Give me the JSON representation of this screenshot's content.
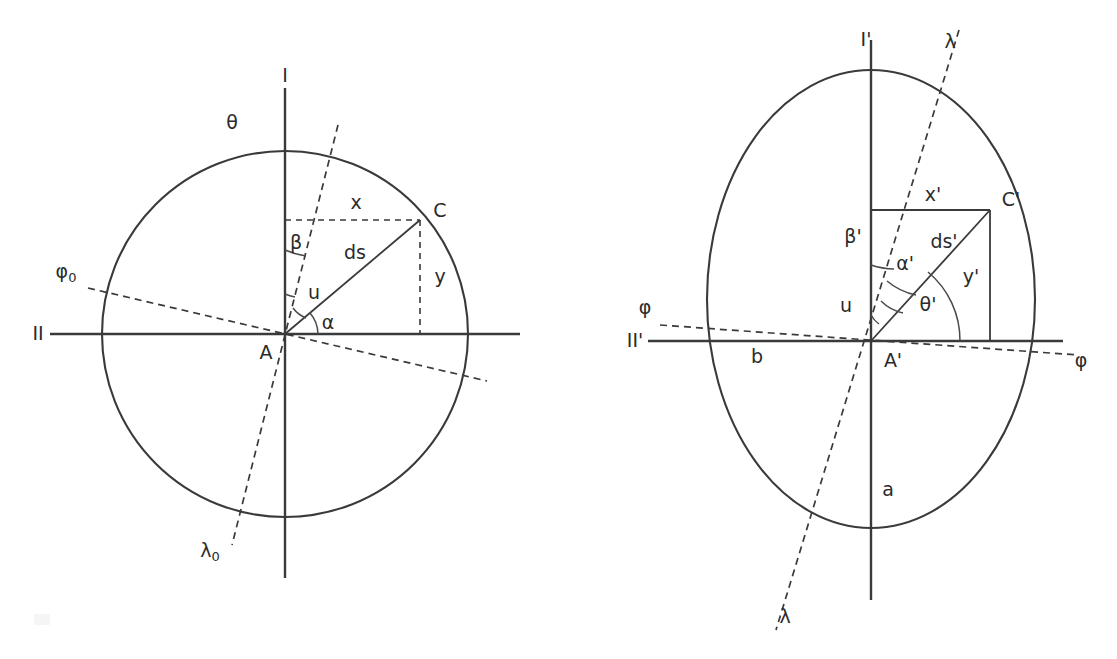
{
  "figure": {
    "title": "",
    "type": "geometric-diagram",
    "background_color": "#ffffff",
    "stroke_color": "#3a3a3a",
    "panels": [
      {
        "id": "left-panel",
        "name": "authalic-sphere-diagram",
        "shape": "circle",
        "center": {
          "x": 285,
          "y": 334
        },
        "radius": 183,
        "center_point_label": "A",
        "surface_point_label": "C",
        "labels": {
          "vertical_axis": "I",
          "horizontal_axis": "II",
          "azimuth_from_vertical": "θ",
          "latitude_line": "φ",
          "latitude_line_sub": "0",
          "longitude_line": "λ",
          "longitude_line_sub": "0",
          "arc_beta": "β",
          "arc_u": "u",
          "arc_alpha": "α",
          "element_of_arc": "ds",
          "horizontal_offset": "x",
          "vertical_offset": "y",
          "center_point": "A",
          "surface_point": "C"
        }
      },
      {
        "id": "right-panel",
        "name": "ellipsoid-diagram",
        "shape": "ellipse",
        "center": {
          "x": 871,
          "y": 299
        },
        "radius_x": 164,
        "radius_y": 229,
        "center_point_label": "A'",
        "surface_point_label": "C'",
        "labels": {
          "vertical_axis": "I'",
          "horizontal_axis": "II'",
          "azimuth_from_horizontal": "θ'",
          "latitude_line_left": "φ",
          "latitude_line_right": "φ",
          "longitude_line_top": "λ",
          "longitude_line_bottom": "λ",
          "arc_beta": "β'",
          "arc_u": "u",
          "arc_alpha": "α'",
          "element_of_arc": "ds'",
          "horizontal_offset": "x'",
          "vertical_offset": "y'",
          "semi_minor_axis": "b",
          "semi_major_axis": "a",
          "center_point": "A'",
          "surface_point": "C'"
        }
      }
    ]
  },
  "left": {
    "axis_I": "I",
    "axis_II": "II",
    "theta": "θ",
    "phi_base": "φ",
    "phi_sub": "0",
    "lambda_base": "λ",
    "lambda_sub": "0",
    "beta": "β",
    "u": "u",
    "alpha": "α",
    "ds": "ds",
    "x": "x",
    "y": "y",
    "A": "A",
    "C": "C"
  },
  "right": {
    "axis_I": "I'",
    "axis_II": "II'",
    "theta": "θ'",
    "phi_left": "φ",
    "phi_right": "φ",
    "lambda_top": "λ",
    "lambda_bottom": "λ",
    "beta": "β'",
    "u": "u",
    "alpha": "α'",
    "ds": "ds'",
    "x": "x'",
    "y": "y'",
    "b": "b",
    "a": "a",
    "A": "A'",
    "C": "C'"
  }
}
